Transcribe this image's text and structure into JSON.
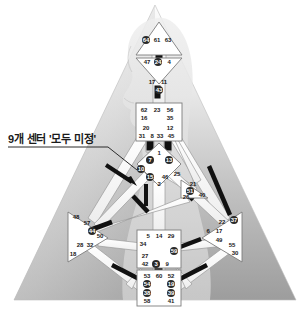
{
  "figure": {
    "annotation": {
      "text": "9개 센터 '모두 미정'",
      "x": 8,
      "y": 130,
      "meaning": "9 centers 'all undefined'"
    }
  },
  "palette": {
    "page_background": "#ffffff",
    "pyramid_top": "#f2f2f2",
    "pyramid_bottom": "#9d9d9d",
    "silhouette": "#dedede",
    "center_fill": "#ffffff",
    "center_stroke": "#7d7d7d",
    "channel_open": "#ffffff",
    "channel_stroke": "#9a9a9a",
    "channel_activated": "#111111",
    "gate_activated_fill": "#2a2a2a",
    "gate_activated_text": "#ffffff",
    "gate_text": "#1a1a1a",
    "leader_line": "#2b2b2b"
  },
  "centers": [
    {
      "id": "head",
      "name": "Head (Crown)",
      "shape": "triangle-up",
      "state": "undefined",
      "cx": 159,
      "cy": 44
    },
    {
      "id": "ajna",
      "name": "Ajna",
      "shape": "triangle-down",
      "state": "undefined",
      "cx": 159,
      "cy": 71
    },
    {
      "id": "throat",
      "name": "Throat",
      "shape": "square",
      "state": "undefined",
      "cx": 159,
      "cy": 120
    },
    {
      "id": "g",
      "name": "G Center / Identity",
      "shape": "diamond",
      "state": "undefined",
      "cx": 159,
      "cy": 164
    },
    {
      "id": "heart",
      "name": "Heart / Ego / Will",
      "shape": "triangle-left",
      "state": "undefined",
      "cx": 196,
      "cy": 188
    },
    {
      "id": "spleen",
      "name": "Spleen",
      "shape": "triangle-right",
      "state": "undefined",
      "cx": 88,
      "cy": 235
    },
    {
      "id": "solar_plexus",
      "name": "Solar Plexus",
      "shape": "triangle-left",
      "state": "undefined",
      "cx": 231,
      "cy": 235
    },
    {
      "id": "sacral",
      "name": "Sacral",
      "shape": "square",
      "state": "undefined",
      "cx": 159,
      "cy": 248
    },
    {
      "id": "root",
      "name": "Root",
      "shape": "square",
      "state": "undefined",
      "cx": 159,
      "cy": 287
    }
  ],
  "gates": [
    {
      "n": "64",
      "x": 146,
      "y": 40,
      "hl": true
    },
    {
      "n": "61",
      "x": 157,
      "y": 40,
      "hl": false
    },
    {
      "n": "63",
      "x": 168,
      "y": 40,
      "hl": false
    },
    {
      "n": "47",
      "x": 147,
      "y": 62,
      "hl": false
    },
    {
      "n": "24",
      "x": 158,
      "y": 62,
      "hl": true
    },
    {
      "n": "4",
      "x": 169,
      "y": 62,
      "hl": false
    },
    {
      "n": "17",
      "x": 152,
      "y": 82,
      "hl": false
    },
    {
      "n": "11",
      "x": 164,
      "y": 82,
      "hl": false
    },
    {
      "n": "43",
      "x": 159,
      "y": 90,
      "hl": true
    },
    {
      "n": "62",
      "x": 144,
      "y": 110,
      "hl": false
    },
    {
      "n": "23",
      "x": 157,
      "y": 110,
      "hl": false
    },
    {
      "n": "56",
      "x": 170,
      "y": 110,
      "hl": false
    },
    {
      "n": "16",
      "x": 144,
      "y": 118,
      "hl": false
    },
    {
      "n": "35",
      "x": 170,
      "y": 118,
      "hl": false
    },
    {
      "n": "20",
      "x": 146,
      "y": 128,
      "hl": false
    },
    {
      "n": "12",
      "x": 170,
      "y": 128,
      "hl": false
    },
    {
      "n": "31",
      "x": 142,
      "y": 136,
      "hl": false
    },
    {
      "n": "8",
      "x": 152,
      "y": 136,
      "hl": false
    },
    {
      "n": "33",
      "x": 160,
      "y": 136,
      "hl": false
    },
    {
      "n": "45",
      "x": 171,
      "y": 136,
      "hl": false
    },
    {
      "n": "1",
      "x": 159,
      "y": 153,
      "hl": false
    },
    {
      "n": "7",
      "x": 150,
      "y": 160,
      "hl": true
    },
    {
      "n": "13",
      "x": 169,
      "y": 160,
      "hl": true
    },
    {
      "n": "10",
      "x": 141,
      "y": 169,
      "hl": true
    },
    {
      "n": "15",
      "x": 150,
      "y": 177,
      "hl": true
    },
    {
      "n": "46",
      "x": 165,
      "y": 177,
      "hl": false
    },
    {
      "n": "2",
      "x": 159,
      "y": 184,
      "hl": false
    },
    {
      "n": "25",
      "x": 177,
      "y": 174,
      "hl": false
    },
    {
      "n": "21",
      "x": 193,
      "y": 184,
      "hl": false
    },
    {
      "n": "51",
      "x": 190,
      "y": 191,
      "hl": true
    },
    {
      "n": "26",
      "x": 186,
      "y": 197,
      "hl": false
    },
    {
      "n": "40",
      "x": 202,
      "y": 195,
      "hl": false
    },
    {
      "n": "48",
      "x": 76,
      "y": 217,
      "hl": false
    },
    {
      "n": "57",
      "x": 87,
      "y": 223,
      "hl": false
    },
    {
      "n": "44",
      "x": 92,
      "y": 231,
      "hl": true
    },
    {
      "n": "50",
      "x": 100,
      "y": 236,
      "hl": false
    },
    {
      "n": "32",
      "x": 90,
      "y": 245,
      "hl": false
    },
    {
      "n": "28",
      "x": 80,
      "y": 245,
      "hl": false
    },
    {
      "n": "18",
      "x": 73,
      "y": 254,
      "hl": false
    },
    {
      "n": "37",
      "x": 234,
      "y": 220,
      "hl": true
    },
    {
      "n": "22",
      "x": 222,
      "y": 222,
      "hl": false
    },
    {
      "n": "6",
      "x": 208,
      "y": 231,
      "hl": false
    },
    {
      "n": "17",
      "x": 219,
      "y": 231,
      "hl": false
    },
    {
      "n": "49",
      "x": 219,
      "y": 240,
      "hl": false
    },
    {
      "n": "55",
      "x": 232,
      "y": 245,
      "hl": false
    },
    {
      "n": "30",
      "x": 235,
      "y": 253,
      "hl": false
    },
    {
      "n": "5",
      "x": 148,
      "y": 236,
      "hl": false
    },
    {
      "n": "14",
      "x": 159,
      "y": 236,
      "hl": false
    },
    {
      "n": "29",
      "x": 171,
      "y": 236,
      "hl": false
    },
    {
      "n": "34",
      "x": 143,
      "y": 244,
      "hl": false
    },
    {
      "n": "27",
      "x": 145,
      "y": 256,
      "hl": false
    },
    {
      "n": "59",
      "x": 174,
      "y": 251,
      "hl": true
    },
    {
      "n": "42",
      "x": 145,
      "y": 264,
      "hl": false
    },
    {
      "n": "3",
      "x": 156,
      "y": 264,
      "hl": true
    },
    {
      "n": "9",
      "x": 167,
      "y": 264,
      "hl": false
    },
    {
      "n": "53",
      "x": 147,
      "y": 276,
      "hl": false
    },
    {
      "n": "60",
      "x": 159,
      "y": 276,
      "hl": false
    },
    {
      "n": "52",
      "x": 171,
      "y": 276,
      "hl": false
    },
    {
      "n": "54",
      "x": 147,
      "y": 284,
      "hl": true
    },
    {
      "n": "19",
      "x": 171,
      "y": 284,
      "hl": true
    },
    {
      "n": "38",
      "x": 147,
      "y": 293,
      "hl": true
    },
    {
      "n": "39",
      "x": 171,
      "y": 293,
      "hl": true
    },
    {
      "n": "58",
      "x": 147,
      "y": 301,
      "hl": false
    },
    {
      "n": "41",
      "x": 171,
      "y": 301,
      "hl": false
    }
  ],
  "activated_channels": [
    {
      "name": "channel-48-16-left",
      "x1": 82,
      "y1": 233,
      "x2": 112,
      "y2": 222
    },
    {
      "name": "channel-10-20-left",
      "x1": 133,
      "y1": 196,
      "x2": 148,
      "y2": 212
    },
    {
      "name": "channel-34-57-vertical",
      "x1": 146,
      "y1": 184,
      "x2": 146,
      "y2": 206
    },
    {
      "name": "channel-26-44-right",
      "x1": 184,
      "y1": 191,
      "x2": 193,
      "y2": 200
    },
    {
      "name": "channel-21-45-right",
      "x1": 209,
      "y1": 166,
      "x2": 230,
      "y2": 215
    },
    {
      "name": "channel-59-6-right",
      "x1": 180,
      "y1": 247,
      "x2": 201,
      "y2": 239
    },
    {
      "name": "channel-54-32-bottomleft",
      "x1": 112,
      "y1": 265,
      "x2": 143,
      "y2": 281
    },
    {
      "name": "channel-19-49-bottomright",
      "x1": 176,
      "y1": 281,
      "x2": 207,
      "y2": 265
    }
  ]
}
